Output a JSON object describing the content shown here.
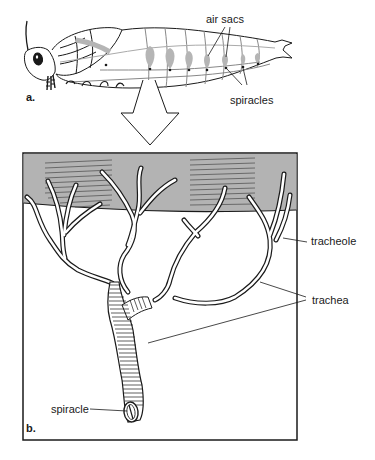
{
  "figure": {
    "panel_a": {
      "label": "a.",
      "subject": "insect larva lateral view",
      "labels": {
        "air_sacs": "air sacs",
        "spiracles": "spiracles"
      }
    },
    "arrow": {
      "direction": "down",
      "meaning": "enlarged view"
    },
    "panel_b": {
      "label": "b.",
      "subject": "tracheal system detail",
      "labels": {
        "tracheole": "tracheole",
        "trachea": "trachea",
        "spiracle": "spiracle"
      }
    }
  },
  "colors": {
    "line": "#1a1a1a",
    "air_sac": "#b5b5b5",
    "tissue_band": "#b3b3b3",
    "background": "#ffffff"
  }
}
